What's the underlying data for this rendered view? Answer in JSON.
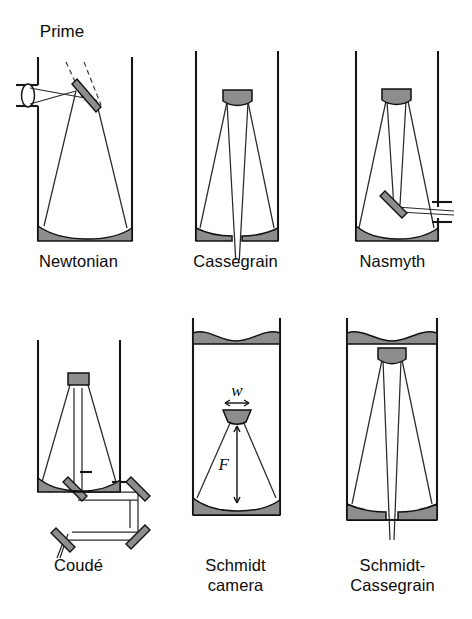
{
  "figure": {
    "type": "diagram",
    "colors": {
      "mirror_gray": "#8d8d8d",
      "outline": "#111111",
      "ray": "#2a2a2a",
      "background": "#ffffff"
    },
    "panels": [
      {
        "id": "newtonian",
        "caption": "Newtonian",
        "caption_lines": [
          "Newtonian"
        ],
        "annotations": [
          {
            "name": "prime-focus-label",
            "text": "Prime"
          }
        ],
        "optics": [
          "tube-wall-left",
          "tube-wall-right",
          "primary-mirror-concave",
          "diagonal-flat-mirror",
          "eyepiece-lens",
          "side-port",
          "prime-focus-dashed-rays"
        ]
      },
      {
        "id": "cassegrain",
        "caption": "Cassegrain",
        "caption_lines": [
          "Cassegrain"
        ],
        "annotations": [],
        "optics": [
          "tube-wall-left",
          "tube-wall-right",
          "primary-mirror-split-with-hole",
          "secondary-convex-mirror",
          "converging-rays-through-hole"
        ]
      },
      {
        "id": "nasmyth",
        "caption": "Nasmyth",
        "caption_lines": [
          "Nasmyth"
        ],
        "annotations": [],
        "optics": [
          "tube-wall-left",
          "tube-wall-right",
          "primary-mirror-concave",
          "secondary-convex-mirror",
          "tertiary-flat-mirror",
          "side-exit-port"
        ]
      },
      {
        "id": "coude",
        "caption": "Coudé",
        "caption_lines": [
          "Coudé"
        ],
        "annotations": [],
        "optics": [
          "tube-wall-left",
          "tube-wall-right",
          "primary-mirror-concave",
          "secondary-mirror-small",
          "flat-mirror-upper-left",
          "flat-mirror-upper-right",
          "flat-mirror-lower-right",
          "flat-mirror-lower-left",
          "folded-beam-path"
        ]
      },
      {
        "id": "schmidt-camera",
        "caption": "Schmidt camera",
        "caption_lines": [
          "Schmidt",
          "camera"
        ],
        "annotations": [
          {
            "name": "detector-width-label",
            "text": "w"
          },
          {
            "name": "focal-length-label",
            "text": "F"
          }
        ],
        "optics": [
          "tube-wall-left",
          "tube-wall-right",
          "corrector-plate-wavy",
          "primary-mirror-concave",
          "curved-focal-plane-detector",
          "width-dimension-arrow",
          "focal-length-dimension-arrow",
          "converging-rays"
        ]
      },
      {
        "id": "schmidt-cassegrain",
        "caption": "Schmidt-Cassegrain",
        "caption_lines": [
          "Schmidt-",
          "Cassegrain"
        ],
        "annotations": [],
        "optics": [
          "tube-wall-left",
          "tube-wall-right",
          "corrector-plate-wavy",
          "primary-mirror-split-with-hole",
          "secondary-convex-mirror",
          "converging-rays-through-hole"
        ]
      }
    ]
  }
}
